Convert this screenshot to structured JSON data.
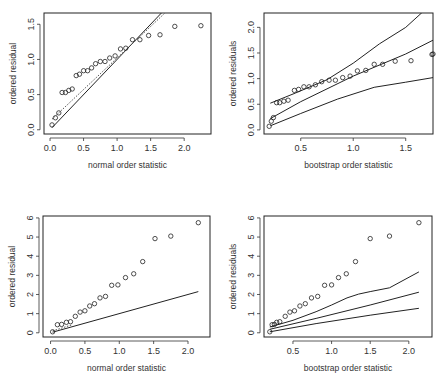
{
  "chart_data": [
    {
      "id": "top-left",
      "type": "scatter",
      "title": "",
      "xlabel": "normal order statistic",
      "ylabel": "ordered residual",
      "box": {
        "x0": 44,
        "y0": 13,
        "x1": 211,
        "y1": 134
      },
      "xlim": [
        -0.09,
        2.4
      ],
      "ylim": [
        -0.06,
        1.66
      ],
      "xticks": [
        0.0,
        0.5,
        1.0,
        1.5,
        2.0
      ],
      "xtick_labels": [
        "0.0",
        "0.5",
        "1.0",
        "1.5",
        "2.0"
      ],
      "yticks": [
        0.0,
        0.5,
        1.0,
        1.5
      ],
      "ytick_labels": [
        "0.0",
        "0.5",
        "1.0",
        "1.5"
      ],
      "x": [
        0.03,
        0.08,
        0.13,
        0.18,
        0.23,
        0.28,
        0.33,
        0.39,
        0.44,
        0.5,
        0.56,
        0.62,
        0.68,
        0.75,
        0.82,
        0.89,
        0.97,
        1.05,
        1.13,
        1.23,
        1.34,
        1.47,
        1.64,
        1.86,
        2.25
      ],
      "y": [
        0.07,
        0.17,
        0.24,
        0.53,
        0.53,
        0.56,
        0.58,
        0.77,
        0.79,
        0.84,
        0.84,
        0.88,
        0.94,
        0.97,
        0.97,
        1.02,
        1.05,
        1.15,
        1.16,
        1.28,
        1.28,
        1.34,
        1.35,
        1.47,
        1.48
      ],
      "lines": [
        {
          "name": "reference line",
          "style": "solid",
          "x": [
            0.03,
            1.72
          ],
          "y": [
            0.03,
            1.72
          ]
        },
        {
          "name": "fitted line",
          "style": "dotted",
          "x": [
            0.03,
            1.78
          ],
          "y": [
            0.15,
            1.72
          ]
        }
      ]
    },
    {
      "id": "top-right",
      "type": "scatter",
      "title": "",
      "xlabel": "bootstrap order statistic",
      "ylabel": "ordered residuals",
      "box": {
        "x0": 264,
        "y0": 13,
        "x1": 433,
        "y1": 134
      },
      "xlim": [
        0.15,
        1.76
      ],
      "ylim": [
        -0.08,
        2.28
      ],
      "xticks": [
        0.5,
        1.0,
        1.5
      ],
      "xtick_labels": [
        "0.5",
        "1.0",
        "1.5"
      ],
      "yticks": [
        0.0,
        0.5,
        1.0,
        1.5,
        2.0
      ],
      "ytick_labels": [
        "0.0",
        "0.5",
        "1.0",
        "1.5",
        "2.0"
      ],
      "x": [
        0.2,
        0.22,
        0.24,
        0.27,
        0.3,
        0.34,
        0.38,
        0.44,
        0.48,
        0.53,
        0.58,
        0.64,
        0.7,
        0.77,
        0.83,
        0.9,
        0.97,
        1.04,
        1.12,
        1.2,
        1.28,
        1.4,
        1.55,
        1.75,
        1.76
      ],
      "y": [
        0.07,
        0.17,
        0.24,
        0.53,
        0.53,
        0.56,
        0.58,
        0.77,
        0.79,
        0.84,
        0.84,
        0.88,
        0.94,
        0.97,
        0.97,
        1.02,
        1.05,
        1.15,
        1.16,
        1.28,
        1.28,
        1.34,
        1.35,
        1.47,
        1.48
      ],
      "lines": [
        {
          "name": "upper envelope",
          "style": "solid",
          "x": [
            0.21,
            0.45,
            0.75,
            1.0,
            1.25,
            1.5,
            1.65,
            1.75
          ],
          "y": [
            0.52,
            0.72,
            0.98,
            1.3,
            1.68,
            2.0,
            2.28,
            2.4
          ]
        },
        {
          "name": "median line",
          "style": "solid",
          "x": [
            0.21,
            0.5,
            1.0,
            1.5,
            1.76
          ],
          "y": [
            0.22,
            0.55,
            1.05,
            1.48,
            1.75
          ]
        },
        {
          "name": "lower envelope",
          "style": "solid",
          "x": [
            0.21,
            0.5,
            0.85,
            1.2,
            1.5,
            1.76
          ],
          "y": [
            0.08,
            0.32,
            0.6,
            0.83,
            0.93,
            1.02
          ]
        }
      ]
    },
    {
      "id": "bottom-left",
      "type": "scatter",
      "title": "",
      "xlabel": "normal order statistic",
      "ylabel": "ordered residual",
      "box": {
        "x0": 43,
        "y0": 216,
        "x1": 210,
        "y1": 337
      },
      "xlim": [
        -0.11,
        2.32
      ],
      "ylim": [
        -0.22,
        6.1
      ],
      "xticks": [
        0.0,
        0.5,
        1.0,
        1.5,
        2.0
      ],
      "xtick_labels": [
        "0.0",
        "0.5",
        "1.0",
        "1.5",
        "2.0"
      ],
      "yticks": [
        0,
        1,
        2,
        3,
        4,
        5,
        6
      ],
      "ytick_labels": [
        "0",
        "1",
        "2",
        "3",
        "4",
        "5",
        "6"
      ],
      "x": [
        0.03,
        0.1,
        0.16,
        0.23,
        0.29,
        0.36,
        0.43,
        0.5,
        0.57,
        0.64,
        0.72,
        0.8,
        0.89,
        0.98,
        1.09,
        1.21,
        1.34,
        1.52,
        1.75,
        2.15
      ],
      "y": [
        0.05,
        0.42,
        0.44,
        0.55,
        0.58,
        0.86,
        1.08,
        1.15,
        1.4,
        1.52,
        1.82,
        1.9,
        2.48,
        2.5,
        2.88,
        3.08,
        3.72,
        4.92,
        5.05,
        5.75
      ],
      "lines": [
        {
          "name": "reference line",
          "style": "solid",
          "x": [
            0.03,
            2.15
          ],
          "y": [
            0.03,
            2.15
          ]
        },
        {
          "name": "fitted line",
          "style": "dotted",
          "x": [
            0.03,
            0.3
          ],
          "y": [
            0.1,
            0.4
          ]
        }
      ]
    },
    {
      "id": "bottom-right",
      "type": "scatter",
      "title": "",
      "xlabel": "bootstrap order statistic",
      "ylabel": "ordered residuals",
      "box": {
        "x0": 264,
        "y0": 216,
        "x1": 432,
        "y1": 337
      },
      "xlim": [
        0.125,
        2.3
      ],
      "ylim": [
        -0.22,
        6.1
      ],
      "xticks": [
        0.5,
        1.0,
        1.5,
        2.0
      ],
      "xtick_labels": [
        "0.5",
        "1.0",
        "1.5",
        "2.0"
      ],
      "yticks": [
        0,
        1,
        2,
        3,
        4,
        5,
        6
      ],
      "ytick_labels": [
        "0",
        "1",
        "2",
        "3",
        "4",
        "5",
        "6"
      ],
      "x": [
        0.2,
        0.23,
        0.26,
        0.29,
        0.33,
        0.4,
        0.46,
        0.52,
        0.59,
        0.66,
        0.74,
        0.82,
        0.91,
        1.0,
        1.09,
        1.19,
        1.31,
        1.5,
        1.75,
        2.13
      ],
      "y": [
        0.05,
        0.42,
        0.44,
        0.55,
        0.58,
        0.86,
        1.08,
        1.15,
        1.4,
        1.52,
        1.82,
        1.9,
        2.48,
        2.5,
        2.88,
        3.08,
        3.72,
        4.92,
        5.05,
        5.75
      ],
      "lines": [
        {
          "name": "upper envelope",
          "style": "solid",
          "x": [
            0.2,
            0.5,
            0.8,
            1.0,
            1.2,
            1.35,
            1.5,
            1.75,
            2.13
          ],
          "y": [
            0.3,
            0.65,
            1.1,
            1.45,
            1.82,
            2.02,
            2.15,
            2.35,
            3.18
          ]
        },
        {
          "name": "median line",
          "style": "solid",
          "x": [
            0.2,
            0.8,
            1.5,
            2.13
          ],
          "y": [
            0.18,
            0.75,
            1.45,
            2.12
          ]
        },
        {
          "name": "lower envelope",
          "style": "solid",
          "x": [
            0.2,
            0.8,
            1.5,
            2.13
          ],
          "y": [
            0.05,
            0.48,
            0.92,
            1.28
          ]
        }
      ]
    }
  ]
}
